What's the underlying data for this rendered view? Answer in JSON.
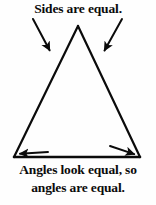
{
  "figure": {
    "name": "isosceles-triangle-annotated-diagram",
    "background_color": "#fefefe",
    "ink_color": "#0b0b0b",
    "width": 156,
    "height": 205
  },
  "captions": {
    "top": "Sides are equal.",
    "bottom_line1": "Angles look equal, so",
    "bottom_line2": "angles are equal."
  },
  "diagram": {
    "shape": "triangle",
    "shape_type": "isosceles",
    "vertices": {
      "apex": {
        "x": 78,
        "y": 26
      },
      "bottom_left": {
        "x": 14,
        "y": 157
      },
      "bottom_right": {
        "x": 140,
        "y": 157
      }
    },
    "stroke_width": 2.2,
    "annotation_arrows": [
      {
        "name": "arrow-to-left-side",
        "from": {
          "x": 33,
          "y": 19
        },
        "to": {
          "x": 51,
          "y": 53
        },
        "points_at": "left-side"
      },
      {
        "name": "arrow-to-right-side",
        "from": {
          "x": 122,
          "y": 19
        },
        "to": {
          "x": 103,
          "y": 53
        },
        "points_at": "right-side"
      },
      {
        "name": "arrow-to-bottom-left-angle",
        "from": {
          "x": 48,
          "y": 152
        },
        "to": {
          "x": 17,
          "y": 154
        },
        "points_at": "bottom-left-angle"
      },
      {
        "name": "arrow-to-bottom-right-angle",
        "from": {
          "x": 110,
          "y": 146
        },
        "to": {
          "x": 137,
          "y": 155
        },
        "points_at": "bottom-right-angle"
      }
    ]
  }
}
